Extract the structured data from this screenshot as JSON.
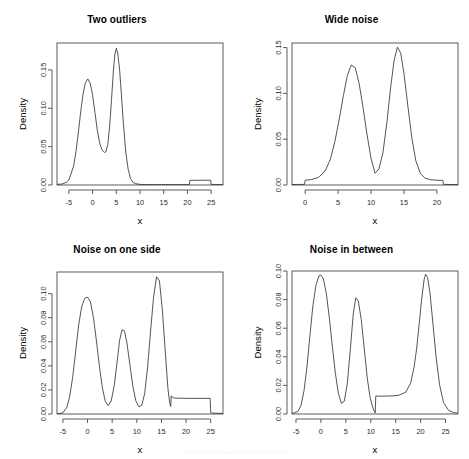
{
  "figure": {
    "caption": "Fig. 3  Kernel estimates with noise and outliers",
    "axis_titles": {
      "x": "x",
      "y": "Density"
    }
  },
  "chart_data": [
    {
      "type": "line",
      "title": "Two outliers",
      "xlabel": "x",
      "ylabel": "Density",
      "xlim": [
        -7.5,
        27.5
      ],
      "ylim": [
        0.0,
        0.185
      ],
      "xticks": [
        -5,
        0,
        5,
        10,
        15,
        20,
        25
      ],
      "xticklabels": [
        "-5",
        "0",
        "5",
        "10",
        "15",
        "20",
        "25"
      ],
      "yticks": [
        0.0,
        0.05,
        0.1,
        0.15
      ],
      "yticklabels": [
        "0.00",
        "0.05",
        "0.10",
        "0.15"
      ],
      "grid": false,
      "legend": null,
      "series": [
        {
          "name": "density",
          "description": "bimodal density with modes at x=0 (0.138) and x=5 (0.178), plus a low uniform shelf of height 0.006 between x=20.5 and x=25",
          "x": [
            -7.5,
            -6.5,
            -5.5,
            -5.0,
            -4.0,
            -3.5,
            -3.0,
            -2.5,
            -2.0,
            -1.5,
            -1.0,
            -0.5,
            0.0,
            0.5,
            1.0,
            1.5,
            2.0,
            2.5,
            2.8,
            3.2,
            3.6,
            4.0,
            4.4,
            4.7,
            5.0,
            5.3,
            5.7,
            6.1,
            6.5,
            7.0,
            7.5,
            8.0,
            8.5,
            9.0,
            10.0,
            11.0,
            13.0,
            16.0,
            19.0,
            20.4,
            20.5,
            22.0,
            24.0,
            24.9,
            25.0,
            26.0,
            27.4
          ],
          "y": [
            0.0008,
            0.0012,
            0.0035,
            0.0065,
            0.0245,
            0.0435,
            0.0685,
            0.0955,
            0.1185,
            0.1335,
            0.1382,
            0.1325,
            0.1175,
            0.0945,
            0.0715,
            0.0545,
            0.0455,
            0.0425,
            0.0432,
            0.0525,
            0.0765,
            0.1115,
            0.1495,
            0.1705,
            0.178,
            0.172,
            0.15,
            0.116,
            0.08,
            0.043,
            0.0205,
            0.0085,
            0.0035,
            0.0018,
            0.0008,
            0.0006,
            0.0005,
            0.0005,
            0.0005,
            0.0005,
            0.006,
            0.0062,
            0.0062,
            0.0062,
            0.0008,
            0.0006,
            0.0005
          ]
        }
      ]
    },
    {
      "type": "line",
      "title": "Wide noise",
      "xlabel": "x",
      "ylabel": "Density",
      "xlim": [
        -2.0,
        23.2
      ],
      "ylim": [
        0.0,
        0.155
      ],
      "xticks": [
        0,
        5,
        10,
        15,
        20
      ],
      "xticklabels": [
        "0",
        "5",
        "10",
        "15",
        "20"
      ],
      "yticks": [
        0.0,
        0.05,
        0.1,
        0.15
      ],
      "yticklabels": [
        "0.00",
        "0.05",
        "0.10",
        "0.15"
      ],
      "grid": false,
      "legend": null,
      "series": [
        {
          "name": "density",
          "description": "two broad modes at x=7 (0.131) and x=14 (0.150), valley 0.012 near x=10.6, uniform shelf of height 0.005 from x=0 to x=21",
          "x": [
            -2.0,
            -0.1,
            0.0,
            1.0,
            2.0,
            3.0,
            3.8,
            4.5,
            5.2,
            5.8,
            6.4,
            7.0,
            7.6,
            8.2,
            8.8,
            9.4,
            10.0,
            10.6,
            11.2,
            11.8,
            12.4,
            13.0,
            13.5,
            14.0,
            14.5,
            15.0,
            15.6,
            16.2,
            16.8,
            17.5,
            18.2,
            19.0,
            20.0,
            20.9,
            21.0,
            22.0,
            23.1
          ],
          "y": [
            0.0005,
            0.0007,
            0.0052,
            0.006,
            0.0082,
            0.015,
            0.0275,
            0.047,
            0.073,
            0.0975,
            0.1195,
            0.131,
            0.128,
            0.1105,
            0.084,
            0.0545,
            0.029,
            0.0128,
            0.0175,
            0.035,
            0.068,
            0.108,
            0.136,
            0.1505,
            0.144,
            0.1215,
            0.0855,
            0.051,
            0.0265,
            0.0125,
            0.0075,
            0.0058,
            0.0052,
            0.005,
            0.0007,
            0.0005,
            0.0005
          ]
        }
      ]
    },
    {
      "type": "line",
      "title": "Noise on one side",
      "xlabel": "x",
      "ylabel": "Density",
      "xlim": [
        -6.2,
        27.5
      ],
      "ylim": [
        0.0,
        0.118
      ],
      "xticks": [
        -5,
        0,
        5,
        10,
        15,
        20,
        25
      ],
      "xticklabels": [
        "-5",
        "0",
        "5",
        "10",
        "15",
        "20",
        "25"
      ],
      "yticks": [
        0.0,
        0.02,
        0.04,
        0.06,
        0.08,
        0.1
      ],
      "yticklabels": [
        "0.00",
        "0.02",
        "0.04",
        "0.06",
        "0.08",
        "0.10"
      ],
      "grid": false,
      "legend": null,
      "series": [
        {
          "name": "density",
          "description": "three modes at x=0 (0.097), x=7 (0.070) and x=14 (0.114); uniform shelf of height 0.013 from x=17 to x=25",
          "x": [
            -6.2,
            -5.0,
            -4.2,
            -3.6,
            -3.0,
            -2.4,
            -1.8,
            -1.2,
            -0.6,
            0.0,
            0.6,
            1.2,
            1.8,
            2.4,
            3.0,
            3.6,
            4.2,
            4.8,
            5.4,
            6.0,
            6.5,
            7.0,
            7.5,
            8.0,
            8.6,
            9.2,
            9.8,
            10.4,
            11.0,
            11.6,
            12.2,
            12.8,
            13.4,
            14.0,
            14.6,
            15.2,
            15.8,
            16.3,
            16.7,
            16.9,
            17.0,
            17.4,
            18.0,
            19.0,
            21.0,
            23.0,
            24.9,
            25.0,
            25.2,
            26.0,
            27.4
          ],
          "y": [
            0.0002,
            0.001,
            0.0055,
            0.015,
            0.031,
            0.0525,
            0.074,
            0.089,
            0.096,
            0.0972,
            0.093,
            0.08,
            0.061,
            0.04,
            0.022,
            0.0105,
            0.007,
            0.0108,
            0.023,
            0.043,
            0.061,
            0.07,
            0.069,
            0.059,
            0.041,
            0.023,
            0.011,
            0.006,
            0.0072,
            0.017,
            0.039,
            0.069,
            0.097,
            0.114,
            0.1105,
            0.086,
            0.051,
            0.022,
            0.0085,
            0.0062,
            0.015,
            0.0135,
            0.0132,
            0.0131,
            0.013,
            0.013,
            0.013,
            0.0012,
            0.0008,
            0.0006,
            0.0005
          ]
        }
      ]
    },
    {
      "type": "line",
      "title": "Noise in between",
      "xlabel": "x",
      "ylabel": "Density",
      "xlim": [
        -5.8,
        27.5
      ],
      "ylim": [
        0.0,
        0.1
      ],
      "xticks": [
        -5,
        0,
        5,
        10,
        15,
        20,
        25
      ],
      "xticklabels": [
        "-5",
        "0",
        "5",
        "10",
        "15",
        "20",
        "25"
      ],
      "yticks": [
        0.0,
        0.02,
        0.04,
        0.06,
        0.08,
        0.1
      ],
      "yticklabels": [
        "0.00",
        "0.02",
        "0.04",
        "0.06",
        "0.08",
        "0.10"
      ],
      "grid": false,
      "legend": null,
      "series": [
        {
          "name": "density",
          "description": "three modes at x=0 (0.097), x=7 (0.081) and x=21 (0.098); uniform shelf of height 0.0125 starting at x=11 and merging into the right mode",
          "x": [
            -5.8,
            -4.6,
            -4.0,
            -3.4,
            -2.8,
            -2.2,
            -1.6,
            -1.0,
            -0.4,
            0.0,
            0.5,
            1.1,
            1.7,
            2.3,
            2.9,
            3.5,
            4.1,
            4.7,
            5.3,
            5.9,
            6.5,
            7.0,
            7.5,
            8.1,
            8.7,
            9.3,
            9.9,
            10.5,
            10.9,
            11.0,
            11.6,
            12.5,
            14.0,
            15.5,
            17.0,
            18.0,
            18.7,
            19.2,
            19.7,
            20.2,
            20.7,
            21.0,
            21.4,
            21.9,
            22.5,
            23.1,
            23.8,
            24.6,
            25.6,
            26.6,
            27.4
          ],
          "y": [
            0.0003,
            0.0018,
            0.006,
            0.016,
            0.033,
            0.055,
            0.076,
            0.09,
            0.0965,
            0.0972,
            0.0945,
            0.084,
            0.067,
            0.047,
            0.0285,
            0.0145,
            0.0075,
            0.009,
            0.0215,
            0.045,
            0.0705,
            0.0812,
            0.079,
            0.066,
            0.0455,
            0.025,
            0.011,
            0.0035,
            0.0008,
            0.0125,
            0.0125,
            0.0125,
            0.0126,
            0.013,
            0.0152,
            0.0215,
            0.033,
            0.0455,
            0.0625,
            0.08,
            0.094,
            0.0978,
            0.0955,
            0.084,
            0.062,
            0.04,
            0.0205,
            0.008,
            0.0026,
            0.001,
            0.0006
          ]
        }
      ]
    }
  ]
}
